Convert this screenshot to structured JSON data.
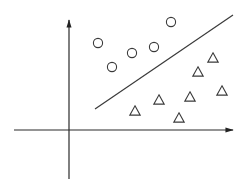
{
  "diagram": {
    "type": "linear-classifier-scatter",
    "colors": {
      "stroke": "#3a3a3a",
      "axis": "#2a2a2a",
      "background": "#ffffff"
    },
    "axes": {
      "origin": [
        69,
        130
      ],
      "x_axis": {
        "from": [
          14,
          130
        ],
        "to": [
          233,
          130
        ],
        "arrow": true
      },
      "y_axis": {
        "from": [
          69,
          179
        ],
        "to": [
          69,
          20
        ],
        "arrow": true
      }
    },
    "decision_boundary": {
      "from": [
        95,
        109
      ],
      "to": [
        233,
        15
      ]
    },
    "classes": [
      {
        "name": "class-circle",
        "marker": "circle",
        "points": [
          [
            98,
            43
          ],
          [
            112,
            67
          ],
          [
            132,
            53
          ],
          [
            154,
            47
          ],
          [
            171,
            22
          ]
        ]
      },
      {
        "name": "class-triangle",
        "marker": "triangle",
        "points": [
          [
            135,
            111
          ],
          [
            159,
            100
          ],
          [
            179,
            118
          ],
          [
            190,
            97
          ],
          [
            198,
            72
          ],
          [
            213,
            58
          ],
          [
            222,
            91
          ]
        ]
      }
    ]
  }
}
